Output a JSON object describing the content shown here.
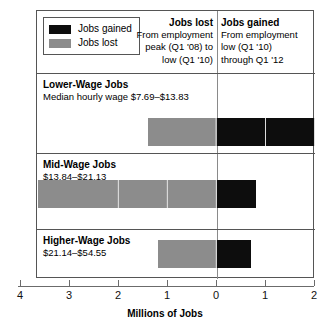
{
  "legend": {
    "items": [
      {
        "label": "Jobs gained",
        "color": "#0d0d0d",
        "swatch_name": "jobs-gained-swatch"
      },
      {
        "label": "Jobs lost",
        "color": "#8c8c8c",
        "swatch_name": "jobs-lost-swatch"
      }
    ]
  },
  "headers": {
    "lost": {
      "title": "Jobs lost",
      "line1": "From employment",
      "line2": "peak (Q1 '08) to",
      "line3": "low (Q1 '10)"
    },
    "gained": {
      "title": "Jobs gained",
      "line1": "From employment",
      "line2": "low (Q1 '10)",
      "line3": "through Q1 '12"
    }
  },
  "rows": [
    {
      "title": "Lower-Wage Jobs",
      "subtitle": "Median hourly wage $7.69–$13.83"
    },
    {
      "title": "Mid-Wage Jobs",
      "subtitle": "$13.84–$21.13"
    },
    {
      "title": "Higher-Wage Jobs",
      "subtitle": "$21.14–$54.55"
    }
  ],
  "axis": {
    "title": "Millions of Jobs",
    "tick_labels": [
      "4",
      "3",
      "2",
      "1",
      "0",
      "1",
      "2"
    ],
    "tick_values": [
      -4,
      -3,
      -2,
      -1,
      0,
      1,
      2
    ]
  },
  "chart_data": {
    "type": "bar",
    "orientation": "horizontal",
    "title": "Millions of Jobs",
    "subtitle": "",
    "xlabel": "Millions of Jobs",
    "ylabel": "",
    "xlim": [
      -4,
      2
    ],
    "grid": false,
    "legend_position": "top-left",
    "categories": [
      "Lower-Wage Jobs",
      "Mid-Wage Jobs",
      "Higher-Wage Jobs"
    ],
    "category_subtitles": [
      "Median hourly wage $7.69–$13.83",
      "$13.84–$21.13",
      "$21.14–$54.55"
    ],
    "series": [
      {
        "name": "Jobs lost",
        "color": "#8c8c8c",
        "values": [
          -1.4,
          -3.65,
          -1.2
        ]
      },
      {
        "name": "Jobs gained",
        "color": "#0d0d0d",
        "values": [
          2.0,
          0.8,
          0.7
        ]
      }
    ],
    "annotations": [
      "Jobs lost: From employment peak (Q1 '08) to low (Q1 '10)",
      "Jobs gained: From employment low (Q1 '10) through Q1 '12"
    ]
  }
}
